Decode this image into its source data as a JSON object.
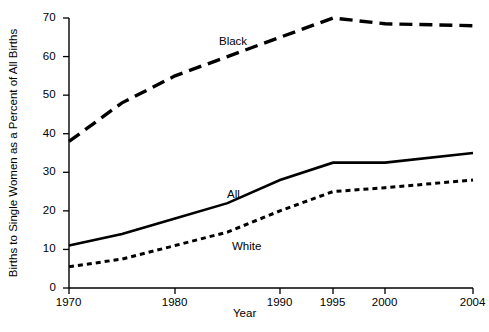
{
  "chart_data": {
    "type": "line",
    "title": "",
    "xlabel": "Year",
    "ylabel": "Births to Single Women as a Percent of All Births",
    "x": [
      1970,
      1975,
      1980,
      1985,
      1990,
      1995,
      2000,
      2004
    ],
    "xticks": [
      1970,
      1980,
      1990,
      1995,
      2000,
      2004
    ],
    "xtick_labels": [
      "1970",
      "1980",
      "1990",
      "1995",
      "2000",
      "2004"
    ],
    "yticks": [
      0,
      10,
      20,
      30,
      40,
      50,
      60,
      70
    ],
    "ytick_labels": [
      "0",
      "10",
      "20",
      "30",
      "40",
      "50",
      "60",
      "70"
    ],
    "xlim": [
      1970,
      2004
    ],
    "ylim": [
      0,
      70
    ],
    "grid": false,
    "legend": "inline-labels",
    "series": [
      {
        "name": "Black",
        "label": "Black",
        "style": "long-dashed",
        "color": "#000000",
        "values": [
          38,
          48,
          55,
          60,
          65,
          70,
          68.5,
          68
        ]
      },
      {
        "name": "All",
        "label": "All",
        "style": "solid",
        "color": "#000000",
        "values": [
          11,
          14,
          18,
          22,
          28,
          32.5,
          32.5,
          35
        ]
      },
      {
        "name": "White",
        "label": "White",
        "style": "short-dashed",
        "color": "#000000",
        "values": [
          5.5,
          7.5,
          11,
          14.5,
          20,
          25,
          26,
          28
        ]
      }
    ],
    "annotations": [
      {
        "text": "Black",
        "x": 1985,
        "y": 63
      },
      {
        "text": "All",
        "x": 1986,
        "y": 26
      },
      {
        "text": "White",
        "x": 1987,
        "y": 12.5
      }
    ]
  },
  "axis": {
    "ylabel": "Births to Single Women as a Percent of All Births",
    "xlabel": "Year",
    "y_ticks": [
      "70",
      "60",
      "50",
      "40",
      "30",
      "20",
      "10",
      "0"
    ],
    "x_ticks": [
      "1970",
      "1980",
      "1990",
      "1995",
      "2000",
      "2004"
    ]
  },
  "labels": {
    "black": "Black",
    "all": "All",
    "white": "White"
  },
  "colors": {
    "line": "#000000",
    "axis": "#000000",
    "background": "#ffffff"
  }
}
